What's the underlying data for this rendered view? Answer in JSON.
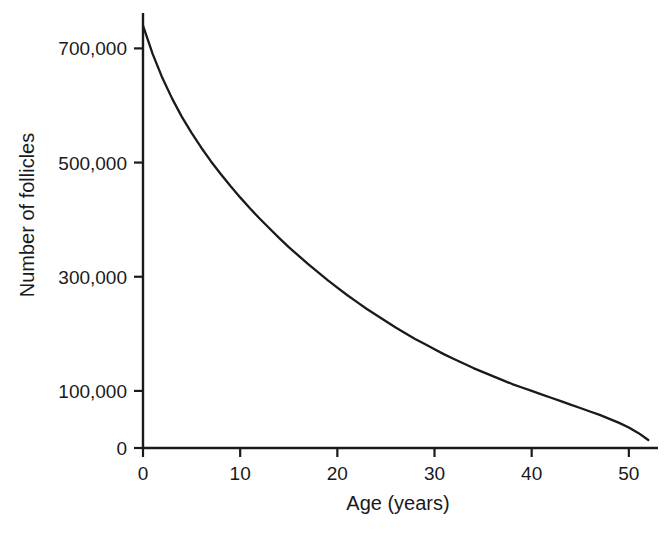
{
  "chart_data": {
    "type": "line",
    "title": "",
    "xlabel": "Age (years)",
    "ylabel": "Number of follicles",
    "xlim": [
      0,
      53
    ],
    "ylim": [
      0,
      762000
    ],
    "grid": false,
    "legend": null,
    "xticks": [
      0,
      10,
      20,
      30,
      40,
      50
    ],
    "xtick_labels": [
      "0",
      "10",
      "20",
      "30",
      "40",
      "50"
    ],
    "yticks": [
      0,
      100000,
      300000,
      500000,
      700000
    ],
    "ytick_labels": [
      "0",
      "100,000",
      "300,000",
      "500,000",
      "700,000"
    ],
    "series": [
      {
        "name": "Ovarian follicle reserve",
        "color": "#1a1a1a",
        "x": [
          0,
          1,
          2,
          3,
          4,
          5,
          6,
          7,
          8,
          9,
          10,
          11,
          12,
          13,
          14,
          15,
          16,
          17,
          18,
          19,
          20,
          21,
          22,
          23,
          24,
          25,
          26,
          27,
          28,
          29,
          30,
          31,
          32,
          33,
          34,
          35,
          36,
          37,
          38,
          39,
          40,
          41,
          42,
          43,
          44,
          45,
          46,
          47,
          48,
          49,
          50,
          51,
          52
        ],
        "y": [
          740000,
          690000,
          648000,
          612000,
          580000,
          552000,
          526000,
          502000,
          480000,
          459000,
          439000,
          420000,
          402000,
          385000,
          368000,
          352000,
          337000,
          322000,
          308000,
          294000,
          281000,
          268000,
          256000,
          244000,
          233000,
          222000,
          211000,
          201000,
          191000,
          182000,
          173000,
          164000,
          156000,
          148000,
          140000,
          133000,
          126000,
          119000,
          112000,
          106000,
          100000,
          94000,
          88000,
          82000,
          76000,
          70000,
          64000,
          58000,
          51000,
          44000,
          36000,
          26000,
          14000
        ]
      }
    ]
  },
  "axis": {
    "x_label": "Age (years)",
    "y_label": "Number of follicles"
  }
}
